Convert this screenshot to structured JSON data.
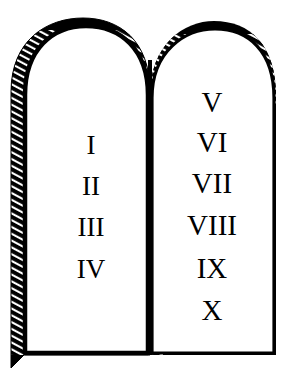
{
  "illustration": {
    "title": "Ten Commandments Tablets",
    "style": "black-and-white line art, hatched shading on left edges",
    "colors": {
      "ink": "#000000",
      "background": "#ffffff",
      "tablet_fill": "#ffffff"
    }
  },
  "tablets": [
    {
      "id": "left-tablet",
      "name": "left-tablet",
      "numerals": [
        {
          "label": "I",
          "value": 1,
          "x": 91,
          "y": 154
        },
        {
          "label": "II",
          "value": 2,
          "x": 91,
          "y": 195
        },
        {
          "label": "III",
          "value": 3,
          "x": 91,
          "y": 236
        },
        {
          "label": "IV",
          "value": 4,
          "x": 91,
          "y": 278
        }
      ]
    },
    {
      "id": "right-tablet",
      "name": "right-tablet",
      "numerals": [
        {
          "label": "V",
          "value": 5,
          "x": 212,
          "y": 112
        },
        {
          "label": "VI",
          "value": 6,
          "x": 212,
          "y": 152
        },
        {
          "label": "VII",
          "value": 7,
          "x": 212,
          "y": 193
        },
        {
          "label": "VIII",
          "value": 8,
          "x": 212,
          "y": 235
        },
        {
          "label": "IX",
          "value": 9,
          "x": 212,
          "y": 278
        },
        {
          "label": "X",
          "value": 10,
          "x": 212,
          "y": 320
        }
      ]
    }
  ]
}
